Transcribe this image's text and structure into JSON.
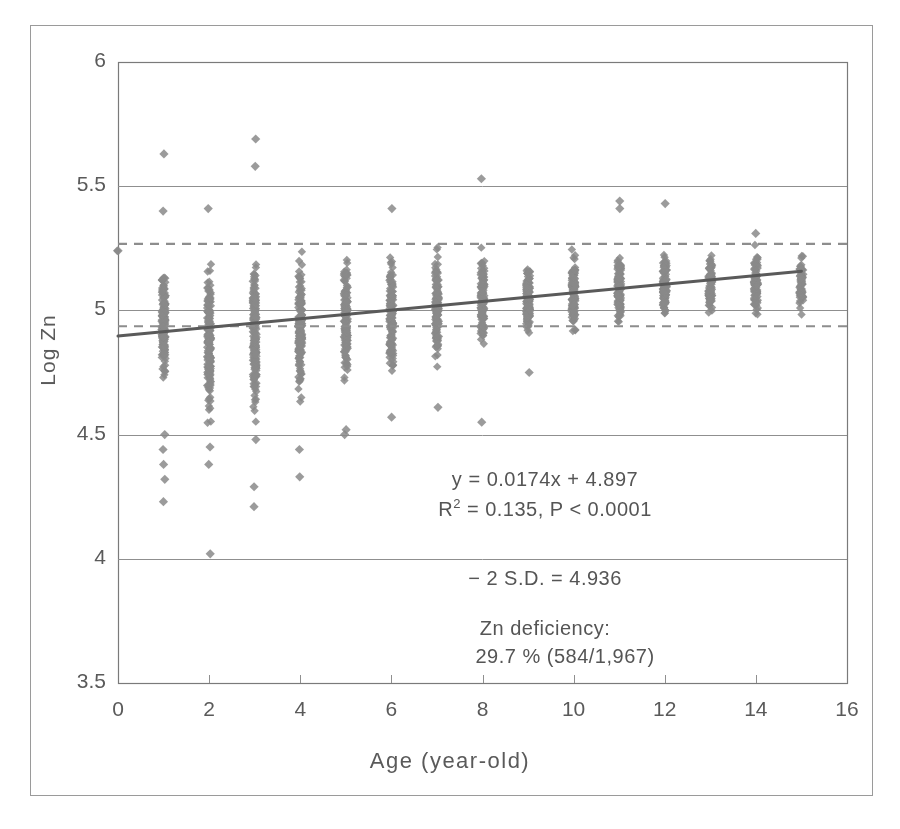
{
  "chart_data": {
    "type": "scatter",
    "title": "",
    "xlabel": "Age (year-old)",
    "ylabel": "Log Zn",
    "xlim": [
      0,
      16
    ],
    "ylim": [
      3.5,
      6
    ],
    "xticks": [
      "0",
      "2",
      "4",
      "6",
      "8",
      "10",
      "12",
      "14",
      "16"
    ],
    "xtick_values": [
      0,
      2,
      4,
      6,
      8,
      10,
      12,
      14,
      16
    ],
    "yticks": [
      "3.5",
      "4",
      "4.5",
      "5",
      "5.5",
      "6"
    ],
    "ytick_values": [
      3.5,
      4,
      4.5,
      5,
      5.5,
      6
    ],
    "grid": true,
    "gridlines_y": [
      4.0,
      4.5,
      5.0,
      5.5
    ],
    "legend": "none",
    "marker": "diamond",
    "marker_color": "#8a8a8a",
    "regression": {
      "slope": 0.0174,
      "intercept": 4.897,
      "r_squared": 0.135,
      "p_value": "< 0.0001",
      "x_start": 0,
      "x_end": 15,
      "y_start": 4.897,
      "y_end": 5.158,
      "color": "#5a5a5a"
    },
    "reference_lines": [
      {
        "name": "upper-dashed",
        "y": 5.268,
        "style": "dashed",
        "color": "#8a8a8a"
      },
      {
        "name": "minus-2-sd",
        "y": 4.936,
        "style": "dashed",
        "color": "#8a8a8a"
      }
    ],
    "series": [
      {
        "name": "Log Zn by age",
        "columns": [
          {
            "age": 0,
            "n": 1,
            "min": 5.24,
            "max": 5.24,
            "q_low": 5.24,
            "q_high": 5.24,
            "outliers": [
              5.24
            ]
          },
          {
            "age": 1,
            "n": 160,
            "min": 4.23,
            "max": 5.63,
            "q_low": 4.62,
            "q_high": 5.26,
            "outliers": [
              5.63,
              5.4,
              4.5,
              4.44,
              4.38,
              4.32,
              4.23
            ]
          },
          {
            "age": 2,
            "n": 175,
            "min": 4.02,
            "max": 5.69,
            "q_low": 4.47,
            "q_high": 5.28,
            "outliers": [
              5.41,
              4.45,
              4.38,
              4.02
            ]
          },
          {
            "age": 3,
            "n": 180,
            "min": 4.21,
            "max": 5.69,
            "q_low": 4.49,
            "q_high": 5.3,
            "outliers": [
              5.69,
              5.58,
              4.48,
              4.29,
              4.21
            ]
          },
          {
            "age": 4,
            "n": 165,
            "min": 4.33,
            "max": 5.31,
            "q_low": 4.58,
            "q_high": 5.29,
            "outliers": [
              4.44,
              4.33
            ]
          },
          {
            "age": 5,
            "n": 150,
            "min": 4.5,
            "max": 5.3,
            "q_low": 4.64,
            "q_high": 5.28,
            "outliers": [
              4.52,
              4.5
            ]
          },
          {
            "age": 6,
            "n": 145,
            "min": 4.57,
            "max": 5.41,
            "q_low": 4.66,
            "q_high": 5.29,
            "outliers": [
              5.41,
              4.57
            ]
          },
          {
            "age": 7,
            "n": 140,
            "min": 4.61,
            "max": 5.33,
            "q_low": 4.72,
            "q_high": 5.3,
            "outliers": [
              4.61
            ]
          },
          {
            "age": 8,
            "n": 135,
            "min": 4.55,
            "max": 5.53,
            "q_low": 4.79,
            "q_high": 5.29,
            "outliers": [
              5.53,
              4.55
            ]
          },
          {
            "age": 9,
            "n": 125,
            "min": 4.75,
            "max": 5.3,
            "q_low": 4.83,
            "q_high": 5.27,
            "outliers": [
              4.75
            ]
          },
          {
            "age": 10,
            "n": 120,
            "min": 4.8,
            "max": 5.3,
            "q_low": 4.86,
            "q_high": 5.28,
            "outliers": []
          },
          {
            "age": 11,
            "n": 115,
            "min": 4.88,
            "max": 5.44,
            "q_low": 4.9,
            "q_high": 5.28,
            "outliers": [
              5.44,
              5.41
            ]
          },
          {
            "age": 12,
            "n": 110,
            "min": 4.9,
            "max": 5.43,
            "q_low": 4.92,
            "q_high": 5.27,
            "outliers": [
              5.43
            ]
          },
          {
            "age": 13,
            "n": 95,
            "min": 4.92,
            "max": 5.28,
            "q_low": 4.95,
            "q_high": 5.26,
            "outliers": []
          },
          {
            "age": 14,
            "n": 85,
            "min": 4.91,
            "max": 5.31,
            "q_low": 4.94,
            "q_high": 5.27,
            "outliers": [
              5.31
            ]
          },
          {
            "age": 15,
            "n": 67,
            "min": 4.92,
            "max": 5.27,
            "q_low": 4.95,
            "q_high": 5.26,
            "outliers": []
          }
        ]
      }
    ],
    "annotations": {
      "equation": "y = 0.0174x + 4.897",
      "r2_prefix": "R",
      "r2_exp": "2",
      "r2_rest": " = 0.135,  P < 0.0001",
      "sd_line": "− 2 S.D. = 4.936",
      "deficiency_label": "Zn deficiency:",
      "deficiency_value": "29.7 %  (584/1,967)"
    }
  },
  "colors": {
    "marker": "#8a8a8a",
    "axis": "#7a7a7a",
    "grid": "#8f8f8f",
    "regression": "#5a5a5a",
    "dashed": "#8d8d8d",
    "text": "#5a5a5a",
    "frame": "#9a9a9a"
  }
}
